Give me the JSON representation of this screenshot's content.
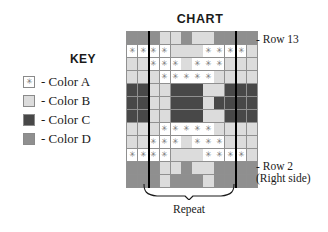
{
  "chart": {
    "title": "CHART",
    "columns": 12,
    "rows": 12,
    "palette": {
      "A": "#ffffff",
      "B": "#dcdcdc",
      "C": "#484848",
      "D": "#8f8f8f"
    },
    "star_glyph": "✳",
    "repeat_start_col": 2,
    "repeat_end_col": 10,
    "cells": [
      [
        "D",
        "D",
        "D",
        "B",
        "B",
        "D",
        "B",
        "B",
        "D",
        "D",
        "D",
        "D"
      ],
      [
        "A",
        "A",
        "A",
        "A",
        "B",
        "B",
        "B",
        "A",
        "A",
        "A",
        "A",
        "B"
      ],
      [
        "B",
        "B",
        "A",
        "A",
        "A",
        "B",
        "A",
        "A",
        "A",
        "B",
        "B",
        "B"
      ],
      [
        "B",
        "B",
        "B",
        "A",
        "A",
        "A",
        "A",
        "A",
        "B",
        "B",
        "B",
        "B"
      ],
      [
        "C",
        "C",
        "B",
        "B",
        "C",
        "C",
        "C",
        "B",
        "B",
        "C",
        "C",
        "C"
      ],
      [
        "C",
        "C",
        "B",
        "B",
        "C",
        "C",
        "C",
        "B",
        "C",
        "C",
        "C",
        "C"
      ],
      [
        "C",
        "C",
        "B",
        "B",
        "C",
        "C",
        "C",
        "B",
        "B",
        "C",
        "C",
        "C"
      ],
      [
        "B",
        "B",
        "B",
        "A",
        "A",
        "A",
        "A",
        "A",
        "B",
        "B",
        "B",
        "B"
      ],
      [
        "B",
        "B",
        "A",
        "A",
        "A",
        "B",
        "A",
        "A",
        "A",
        "B",
        "B",
        "B"
      ],
      [
        "A",
        "A",
        "A",
        "A",
        "B",
        "B",
        "B",
        "A",
        "A",
        "A",
        "A",
        "B"
      ],
      [
        "D",
        "D",
        "D",
        "B",
        "B",
        "D",
        "B",
        "B",
        "D",
        "D",
        "D",
        "D"
      ],
      [
        "D",
        "D",
        "D",
        "B",
        "D",
        "D",
        "D",
        "B",
        "D",
        "D",
        "D",
        "D"
      ]
    ]
  },
  "key": {
    "title": "KEY",
    "items": [
      {
        "swatch": "A",
        "label": "- Color A",
        "has_star": true
      },
      {
        "swatch": "B",
        "label": "- Color B",
        "has_star": false
      },
      {
        "swatch": "C",
        "label": "- Color C",
        "has_star": false
      },
      {
        "swatch": "D",
        "label": "- Color D",
        "has_star": false
      }
    ]
  },
  "annotations": {
    "row_top": "- Row 13",
    "row_bottom": "- Row 2",
    "row_bottom_sub": "(Right side)",
    "repeat": "Repeat"
  },
  "chart_data": {
    "type": "heatmap",
    "title": "CHART",
    "xlabel": "",
    "ylabel": "",
    "grid": true,
    "legend_position": "left",
    "categories_x": [
      1,
      2,
      3,
      4,
      5,
      6,
      7,
      8,
      9,
      10,
      11,
      12
    ],
    "categories_y": [
      13,
      12,
      11,
      10,
      9,
      8,
      7,
      6,
      5,
      4,
      3,
      2
    ],
    "legend": [
      "Color A",
      "Color B",
      "Color C",
      "Color D"
    ],
    "colors": [
      "#ffffff",
      "#dcdcdc",
      "#484848",
      "#8f8f8f"
    ],
    "values": [
      [
        "D",
        "D",
        "D",
        "B",
        "B",
        "D",
        "B",
        "B",
        "D",
        "D",
        "D",
        "D"
      ],
      [
        "A",
        "A",
        "A",
        "A",
        "B",
        "B",
        "B",
        "A",
        "A",
        "A",
        "A",
        "B"
      ],
      [
        "B",
        "B",
        "A",
        "A",
        "A",
        "B",
        "A",
        "A",
        "A",
        "B",
        "B",
        "B"
      ],
      [
        "B",
        "B",
        "B",
        "A",
        "A",
        "A",
        "A",
        "A",
        "B",
        "B",
        "B",
        "B"
      ],
      [
        "C",
        "C",
        "B",
        "B",
        "C",
        "C",
        "C",
        "B",
        "B",
        "C",
        "C",
        "C"
      ],
      [
        "C",
        "C",
        "B",
        "B",
        "C",
        "C",
        "C",
        "B",
        "C",
        "C",
        "C",
        "C"
      ],
      [
        "C",
        "C",
        "B",
        "B",
        "C",
        "C",
        "C",
        "B",
        "B",
        "C",
        "C",
        "C"
      ],
      [
        "B",
        "B",
        "B",
        "A",
        "A",
        "A",
        "A",
        "A",
        "B",
        "B",
        "B",
        "B"
      ],
      [
        "B",
        "B",
        "A",
        "A",
        "A",
        "B",
        "A",
        "A",
        "A",
        "B",
        "B",
        "B"
      ],
      [
        "A",
        "A",
        "A",
        "A",
        "B",
        "B",
        "B",
        "A",
        "A",
        "A",
        "A",
        "B"
      ],
      [
        "D",
        "D",
        "D",
        "B",
        "B",
        "D",
        "B",
        "B",
        "D",
        "D",
        "D",
        "D"
      ],
      [
        "D",
        "D",
        "D",
        "B",
        "D",
        "D",
        "D",
        "B",
        "D",
        "D",
        "D",
        "D"
      ]
    ],
    "annotations": [
      "- Row 13",
      "- Row 2",
      "(Right side)",
      "Repeat"
    ]
  }
}
